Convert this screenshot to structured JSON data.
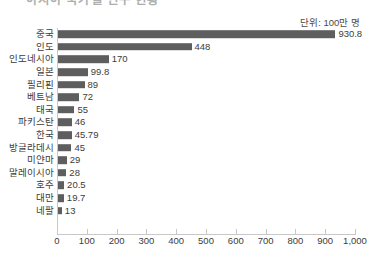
{
  "title_clipped": "아시아 국가별 인구 현황",
  "unit_note": "단위: 100만 명",
  "colors": {
    "bar": "#5e5e5e",
    "axis": "#c8c8c8",
    "text": "#3c3c3c",
    "background": "#ffffff"
  },
  "chart_data": {
    "type": "bar",
    "orientation": "horizontal",
    "title": "",
    "subtitle": "단위: 100만 명",
    "xlabel": "",
    "ylabel": "",
    "xlim": [
      0,
      1000
    ],
    "grid": false,
    "legend": false,
    "categories": [
      "중국",
      "인도",
      "인도네시아",
      "일본",
      "필리핀",
      "베트남",
      "태국",
      "파키스탄",
      "한국",
      "방글라데시",
      "미얀마",
      "말레이시아",
      "호주",
      "대만",
      "네팔"
    ],
    "values": [
      930.8,
      448,
      170,
      99.8,
      89,
      72,
      55,
      46,
      45.79,
      45,
      29,
      28,
      20.5,
      19.7,
      13
    ],
    "value_labels": [
      "930.8",
      "448",
      "170",
      "99.8",
      "89",
      "72",
      "55",
      "46",
      "45.79",
      "45",
      "29",
      "28",
      "20.5",
      "19.7",
      "13"
    ],
    "xticks": [
      0,
      100,
      200,
      300,
      400,
      500,
      600,
      700,
      800,
      900,
      1000
    ],
    "xticklabels": [
      "0",
      "100",
      "200",
      "300",
      "400",
      "500",
      "600",
      "700",
      "800",
      "900",
      "1,000"
    ]
  }
}
